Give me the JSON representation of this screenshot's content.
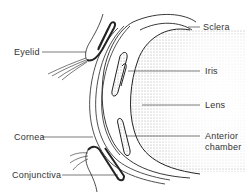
{
  "figure": {
    "colors": {
      "ink": "#222222",
      "label_text": "#333333",
      "background": "#ffffff",
      "stipple": "#555555"
    }
  },
  "labels": {
    "left": [
      {
        "id": "eyelid",
        "text": "Eyelid"
      },
      {
        "id": "cornea",
        "text": "Cornea"
      },
      {
        "id": "conjunctiva",
        "text": "Conjunctiva"
      }
    ],
    "right": [
      {
        "id": "sclera",
        "text": "Sclera"
      },
      {
        "id": "iris",
        "text": "Iris"
      },
      {
        "id": "lens",
        "text": "Lens"
      },
      {
        "id": "anterior_chamber_line1",
        "text": "Anterior"
      },
      {
        "id": "anterior_chamber_line2",
        "text": "chamber"
      }
    ]
  }
}
